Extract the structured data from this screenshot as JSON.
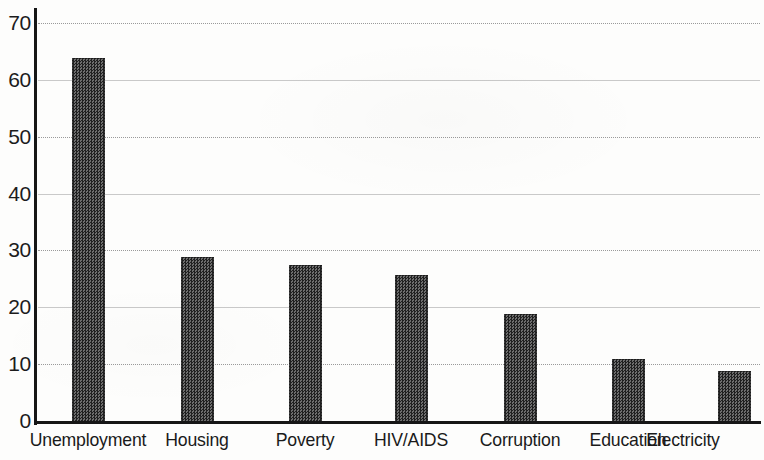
{
  "chart_data": {
    "type": "bar",
    "title": "",
    "subtitle": "",
    "xlabel": "",
    "ylabel": "",
    "categories": [
      "Unemployment",
      "Housing",
      "Poverty",
      "HIV/AIDS",
      "Corruption",
      "Education",
      "Electricity"
    ],
    "values": [
      64,
      29,
      27.7,
      25.8,
      19,
      11,
      9
    ],
    "series": [
      {
        "name": "",
        "values": [
          64,
          29,
          27.7,
          25.8,
          19,
          11,
          9
        ]
      }
    ],
    "ylim": [
      0,
      70
    ],
    "ytick_labels": [
      "0",
      "10",
      "20",
      "30",
      "40",
      "50",
      "60",
      "70"
    ],
    "ytick_values": [
      0,
      10,
      20,
      30,
      40,
      50,
      60,
      70
    ],
    "grid": "horizontal-dotted",
    "legend": "none",
    "bar_fill": "#3a3a3a",
    "axis_color": "#161616",
    "gridline_color": "#9a9a9a",
    "background": "#fdfdfc"
  }
}
